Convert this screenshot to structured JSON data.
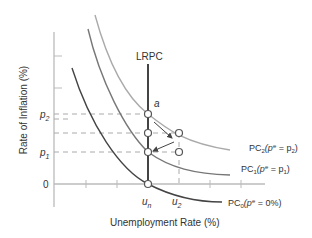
{
  "diagram": {
    "type": "phillips-curve",
    "y_axis_label": "Rate of Inflation (%)",
    "x_axis_label": "Unemployment Rate (%)",
    "lrpc_label": "LRPC",
    "point_label_a": "a",
    "y_ticks": {
      "p2": "p",
      "p2_sub": "2",
      "p1": "p",
      "p1_sub": "1",
      "zero": "0"
    },
    "x_ticks": {
      "un": "u",
      "un_sub": "n",
      "u2": "u",
      "u2_sub": "2"
    },
    "curves": [
      {
        "name": "PC2",
        "label_main": "PC",
        "label_sub": "2",
        "label_expr": "(p",
        "label_sup": "e",
        "label_rest": " = p",
        "label_rest_sub": "2",
        "label_close": ")",
        "color": "#aaaaaa"
      },
      {
        "name": "PC1",
        "label_main": "PC",
        "label_sub": "1",
        "label_expr": "(p",
        "label_sup": "e",
        "label_rest": " = p",
        "label_rest_sub": "1",
        "label_close": ")",
        "color": "#777777"
      },
      {
        "name": "PC0",
        "label_main": "PC",
        "label_sub": "0",
        "label_expr": "(p",
        "label_sup": "e",
        "label_rest": " = 0%)",
        "color": "#444444"
      }
    ],
    "colors": {
      "axis": "#bbbbbb",
      "lrpc": "#444444",
      "dashed": "#aaaaaa",
      "text": "#333333"
    }
  }
}
